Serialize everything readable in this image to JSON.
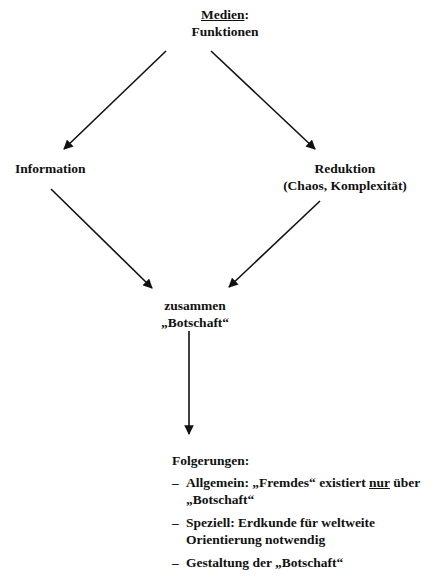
{
  "top": {
    "title": "Medien",
    "title_suffix": ":",
    "subtitle": "Funktionen"
  },
  "left_node": {
    "label": "Information"
  },
  "right_node": {
    "label": "Reduktion",
    "sublabel": "(Chaos, Komplexität)"
  },
  "middle_node": {
    "label": "zusammen",
    "sublabel": "„Botschaft“"
  },
  "conclusions": {
    "heading": "Folgerungen:",
    "items": [
      {
        "dash": "–",
        "text_before": "Allgemein: „Fremdes“ existiert ",
        "emphasis": "nur",
        "text_after": " über „Botschaft“"
      },
      {
        "dash": "–",
        "text": "Speziell: Erdkunde für weltweite Orientierung notwendig"
      },
      {
        "dash": "–",
        "text": "Gestaltung der „Botschaft“"
      }
    ]
  },
  "colors": {
    "ink": "#111111",
    "background": "#ffffff"
  }
}
